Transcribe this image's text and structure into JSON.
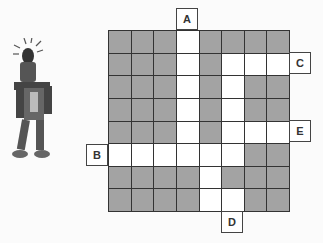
{
  "puzzle": {
    "rows": 8,
    "cols": 8,
    "cells": [
      "GGGWGGGG",
      "GGGWGWWW",
      "GGGWGWGG",
      "GGGWGWGG",
      "GGGWGWWW",
      "WWWWWWGG",
      "GGGGWGGG",
      "GGGGWWGG"
    ],
    "colors": {
      "wall": "#a3a3a3",
      "path": "#ffffff",
      "line": "#333333"
    },
    "exits": [
      {
        "label": "A",
        "side": "top",
        "index": 3
      },
      {
        "label": "B",
        "side": "left",
        "index": 5
      },
      {
        "label": "C",
        "side": "right",
        "index": 1
      },
      {
        "label": "D",
        "side": "bottom",
        "index": 5
      },
      {
        "label": "E",
        "side": "right",
        "index": 4
      }
    ]
  },
  "character": {
    "icon": "robot-icon"
  }
}
